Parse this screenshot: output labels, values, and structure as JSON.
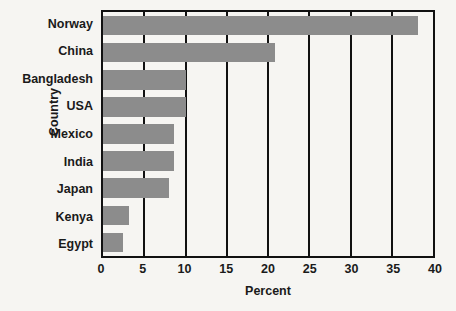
{
  "chart_data": {
    "type": "bar",
    "orientation": "horizontal",
    "title": "",
    "xlabel": "Percent",
    "ylabel": "Country",
    "categories": [
      "Norway",
      "China",
      "Bangladesh",
      "USA",
      "Mexico",
      "India",
      "Japan",
      "Kenya",
      "Egypt"
    ],
    "values": [
      38.2,
      20.8,
      10.0,
      10.0,
      8.6,
      8.6,
      8.0,
      3.2,
      2.4
    ],
    "xlim": [
      0,
      40
    ],
    "xticks": [
      0,
      5,
      10,
      15,
      20,
      25,
      30,
      35,
      40
    ],
    "xtick_labels": [
      "0",
      "5",
      "10",
      "15",
      "20",
      "25",
      "30",
      "35",
      "40"
    ],
    "grid": "vertical",
    "legend": "none",
    "series": [
      {
        "name": "Percent",
        "values": [
          38.2,
          20.8,
          10.0,
          10.0,
          8.6,
          8.6,
          8.0,
          3.2,
          2.4
        ]
      }
    ]
  },
  "colors": {
    "bar_fill": "#8c8c8c",
    "axis": "#111111",
    "background": "#f6f5f2",
    "text": "#1a1a1a"
  }
}
